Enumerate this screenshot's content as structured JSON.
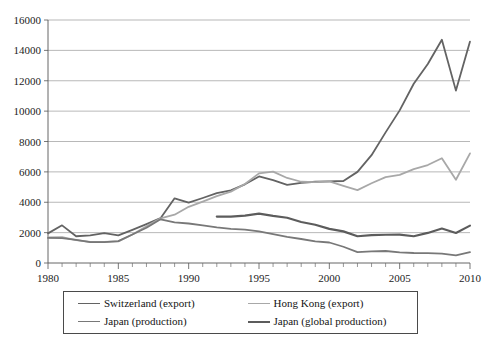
{
  "chart_data": {
    "type": "line",
    "title": "",
    "subtitle": "",
    "xlabel": "",
    "ylabel": "",
    "xlim": [
      1980,
      2010
    ],
    "ylim": [
      0,
      16000
    ],
    "y_ticks": [
      0,
      2000,
      4000,
      6000,
      8000,
      10000,
      12000,
      14000,
      16000
    ],
    "x_ticks": [
      1980,
      1985,
      1990,
      1995,
      2000,
      2005,
      2010
    ],
    "x_minor_tick_interval": 1,
    "grid": "horizontal",
    "legend_position": "below",
    "x": [
      1980,
      1981,
      1982,
      1983,
      1984,
      1985,
      1986,
      1987,
      1988,
      1989,
      1990,
      1991,
      1992,
      1993,
      1994,
      1995,
      1996,
      1997,
      1998,
      1999,
      2000,
      2001,
      2002,
      2003,
      2004,
      2005,
      2006,
      2007,
      2008,
      2009,
      2010
    ],
    "series": [
      {
        "name": "Switzerland (export)",
        "color": "#636363",
        "width": 1.8,
        "values": [
          1950,
          2480,
          1760,
          1820,
          1960,
          1820,
          2180,
          2560,
          2950,
          4260,
          3980,
          4280,
          4600,
          4780,
          5180,
          5700,
          5450,
          5150,
          5280,
          5350,
          5380,
          5400,
          6000,
          7100,
          8600,
          10050,
          11800,
          13100,
          14700,
          11350,
          14580
        ]
      },
      {
        "name": "Hong Kong (export)",
        "color": "#a8a8a8",
        "width": 1.8,
        "values": [
          1680,
          1700,
          1500,
          1390,
          1390,
          1420,
          1880,
          2420,
          2940,
          3180,
          3700,
          4040,
          4400,
          4700,
          5200,
          5900,
          6020,
          5600,
          5350,
          5320,
          5380,
          5080,
          4800,
          5250,
          5650,
          5800,
          6180,
          6450,
          6900,
          5480,
          7220
        ]
      },
      {
        "name": "Japan (production)",
        "color": "#787878",
        "width": 1.8,
        "values": [
          1650,
          1640,
          1520,
          1370,
          1370,
          1440,
          1880,
          2320,
          2880,
          2680,
          2600,
          2480,
          2350,
          2250,
          2200,
          2080,
          1900,
          1720,
          1580,
          1420,
          1350,
          1070,
          720,
          760,
          790,
          700,
          660,
          650,
          620,
          500,
          710
        ]
      },
      {
        "name": "Japan (global production)",
        "color": "#5c5c5c",
        "width": 2.2,
        "start_year": 1992,
        "values": [
          null,
          null,
          null,
          null,
          null,
          null,
          null,
          null,
          null,
          null,
          null,
          null,
          3060,
          3060,
          3120,
          3250,
          3100,
          2980,
          2700,
          2520,
          2250,
          2080,
          1760,
          1830,
          1860,
          1870,
          1760,
          1980,
          2270,
          1980,
          2460
        ]
      }
    ]
  },
  "legend": {
    "entries": [
      {
        "label": "Switzerland (export)",
        "color": "#636363",
        "width": "1.8px"
      },
      {
        "label": "Hong Kong (export)",
        "color": "#a8a8a8",
        "width": "1.8px"
      },
      {
        "label": "Japan (production)",
        "color": "#787878",
        "width": "1.8px"
      },
      {
        "label": "Japan (global production)",
        "color": "#5c5c5c",
        "width": "2.4px"
      }
    ]
  }
}
